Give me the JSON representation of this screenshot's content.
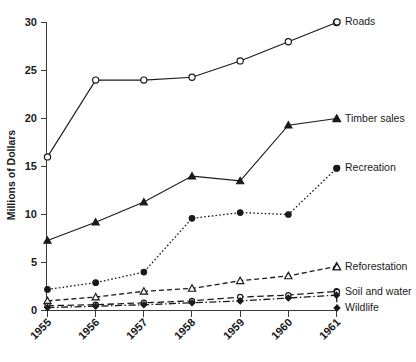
{
  "chart_data": {
    "type": "line",
    "title": "",
    "xlabel": "",
    "ylabel": "Millions of Dollars",
    "categories": [
      "1955",
      "1956",
      "1957",
      "1958",
      "1959",
      "1960",
      "1961"
    ],
    "x": [
      1955,
      1956,
      1957,
      1958,
      1959,
      1960,
      1961
    ],
    "ylim": [
      0,
      30
    ],
    "yticks": [
      0,
      5,
      10,
      15,
      20,
      25,
      30
    ],
    "ytick_labels": [
      "0",
      "5",
      "10",
      "15",
      "20",
      "25",
      "30"
    ],
    "grid": false,
    "legend_position": "right-inline-end-of-line",
    "series": [
      {
        "name": "Roads",
        "values": [
          16.0,
          24.0,
          24.0,
          24.3,
          26.0,
          28.0,
          30.0
        ],
        "marker": "open-circle",
        "linestyle": "solid",
        "color": "#1a1a1a"
      },
      {
        "name": "Timber sales",
        "values": [
          7.3,
          9.2,
          11.3,
          14.0,
          13.5,
          19.3,
          20.0
        ],
        "marker": "filled-triangle",
        "linestyle": "solid",
        "color": "#1a1a1a"
      },
      {
        "name": "Recreation",
        "values": [
          2.2,
          2.9,
          4.0,
          9.6,
          10.2,
          10.0,
          14.8
        ],
        "marker": "filled-circle",
        "linestyle": "dotted",
        "color": "#1a1a1a"
      },
      {
        "name": "Reforestation",
        "values": [
          1.0,
          1.4,
          2.0,
          2.3,
          3.1,
          3.6,
          4.6
        ],
        "marker": "open-triangle",
        "linestyle": "dashed",
        "color": "#1a1a1a"
      },
      {
        "name": "Soil and water",
        "values": [
          0.5,
          0.6,
          0.8,
          1.0,
          1.4,
          1.6,
          2.0
        ],
        "marker": "open-circle-small",
        "linestyle": "dashed-long",
        "color": "#1a1a1a"
      },
      {
        "name": "Wildlife",
        "values": [
          0.3,
          0.45,
          0.6,
          0.8,
          1.0,
          1.3,
          1.6
        ],
        "marker": "filled-diamond",
        "linestyle": "dash-dot",
        "color": "#1a1a1a"
      }
    ]
  },
  "axes": {
    "y_axis_title": "Millions of Dollars",
    "y_tick_labels": [
      "30",
      "25",
      "20",
      "15",
      "10",
      "5",
      "0"
    ],
    "x_tick_labels": [
      "1955",
      "1956",
      "1957",
      "1958",
      "1959",
      "1960",
      "1961"
    ]
  },
  "labels": {
    "roads": "Roads",
    "timber_sales": "Timber sales",
    "recreation": "Recreation",
    "reforestation": "Reforestation",
    "soil_and_water": "Soil and water",
    "wildlife": "Wildlife"
  }
}
